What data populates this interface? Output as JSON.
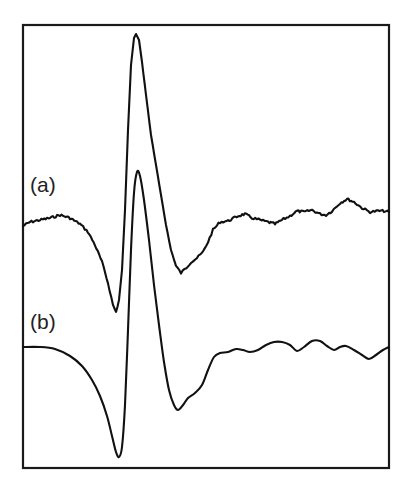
{
  "chart_data": {
    "type": "line",
    "title": "",
    "xlabel": "",
    "ylabel": "",
    "grid": false,
    "legend": "none",
    "axes_ticks": "none",
    "frame": {
      "x0": 23,
      "y0": 25,
      "x1": 389,
      "y1": 468
    },
    "series": [
      {
        "name": "(a)",
        "label": "(a)",
        "label_pos": [
          30,
          192
        ],
        "color": "#111111",
        "noisy": true,
        "points": [
          [
            23,
            226
          ],
          [
            30,
            222
          ],
          [
            40,
            220
          ],
          [
            50,
            218
          ],
          [
            60,
            215
          ],
          [
            70,
            218
          ],
          [
            80,
            224
          ],
          [
            88,
            232
          ],
          [
            95,
            245
          ],
          [
            102,
            262
          ],
          [
            108,
            283
          ],
          [
            113,
            305
          ],
          [
            116,
            312
          ],
          [
            119,
            300
          ],
          [
            122,
            270
          ],
          [
            125,
            210
          ],
          [
            128,
            130
          ],
          [
            131,
            65
          ],
          [
            134,
            38
          ],
          [
            136,
            34
          ],
          [
            139,
            40
          ],
          [
            142,
            62
          ],
          [
            146,
            95
          ],
          [
            151,
            135
          ],
          [
            156,
            165
          ],
          [
            161,
            195
          ],
          [
            166,
            225
          ],
          [
            171,
            250
          ],
          [
            176,
            266
          ],
          [
            181,
            273
          ],
          [
            186,
            268
          ],
          [
            191,
            262
          ],
          [
            197,
            258
          ],
          [
            203,
            252
          ],
          [
            208,
            242
          ],
          [
            213,
            230
          ],
          [
            220,
            222
          ],
          [
            228,
            221
          ],
          [
            238,
            216
          ],
          [
            245,
            214
          ],
          [
            252,
            218
          ],
          [
            260,
            220
          ],
          [
            268,
            222
          ],
          [
            275,
            224
          ],
          [
            282,
            220
          ],
          [
            290,
            216
          ],
          [
            297,
            211
          ],
          [
            304,
            212
          ],
          [
            312,
            210
          ],
          [
            320,
            214
          ],
          [
            326,
            215
          ],
          [
            332,
            211
          ],
          [
            340,
            203
          ],
          [
            347,
            199
          ],
          [
            354,
            202
          ],
          [
            362,
            208
          ],
          [
            370,
            212
          ],
          [
            378,
            211
          ],
          [
            384,
            211
          ],
          [
            389,
            212
          ]
        ]
      },
      {
        "name": "(b)",
        "label": "(b)",
        "label_pos": [
          30,
          329
        ],
        "color": "#111111",
        "noisy": false,
        "points": [
          [
            23,
            347
          ],
          [
            40,
            347
          ],
          [
            55,
            349
          ],
          [
            70,
            356
          ],
          [
            82,
            366
          ],
          [
            92,
            380
          ],
          [
            100,
            396
          ],
          [
            107,
            416
          ],
          [
            112,
            436
          ],
          [
            116,
            452
          ],
          [
            119,
            457
          ],
          [
            122,
            447
          ],
          [
            125,
            405
          ],
          [
            128,
            330
          ],
          [
            131,
            250
          ],
          [
            134,
            193
          ],
          [
            137,
            172
          ],
          [
            140,
            176
          ],
          [
            144,
            200
          ],
          [
            149,
            240
          ],
          [
            154,
            285
          ],
          [
            159,
            325
          ],
          [
            164,
            362
          ],
          [
            169,
            390
          ],
          [
            174,
            405
          ],
          [
            178,
            410
          ],
          [
            183,
            405
          ],
          [
            188,
            398
          ],
          [
            195,
            393
          ],
          [
            202,
            385
          ],
          [
            208,
            370
          ],
          [
            214,
            357
          ],
          [
            220,
            353
          ],
          [
            228,
            352
          ],
          [
            236,
            349
          ],
          [
            243,
            350
          ],
          [
            250,
            352
          ],
          [
            258,
            350
          ],
          [
            266,
            345
          ],
          [
            274,
            342
          ],
          [
            282,
            342
          ],
          [
            290,
            345
          ],
          [
            297,
            351
          ],
          [
            304,
            347
          ],
          [
            312,
            341
          ],
          [
            320,
            341
          ],
          [
            327,
            346
          ],
          [
            334,
            350
          ],
          [
            340,
            347
          ],
          [
            346,
            346
          ],
          [
            354,
            350
          ],
          [
            362,
            355
          ],
          [
            369,
            359
          ],
          [
            376,
            355
          ],
          [
            383,
            350
          ],
          [
            389,
            347
          ]
        ]
      }
    ]
  }
}
